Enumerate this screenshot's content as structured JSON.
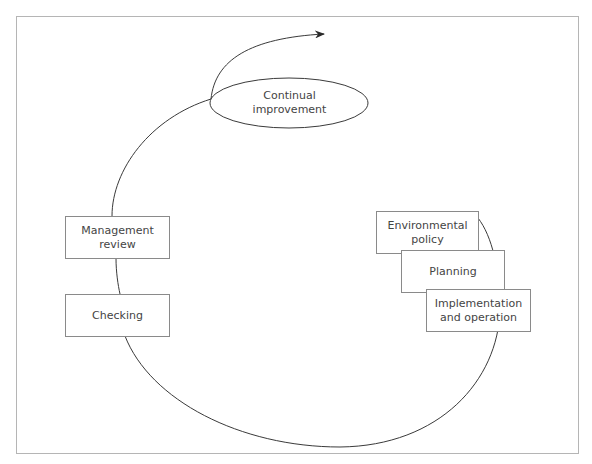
{
  "diagram": {
    "type": "cycle",
    "title": "",
    "nodes": [
      {
        "id": "continual-improvement",
        "label": "Continual\nimprovement",
        "shape": "ellipse"
      },
      {
        "id": "environmental-policy",
        "label": "Environmental\npolicy",
        "shape": "rect"
      },
      {
        "id": "planning",
        "label": "Planning",
        "shape": "rect"
      },
      {
        "id": "implementation-operation",
        "label": "Implementation\nand operation",
        "shape": "rect"
      },
      {
        "id": "checking",
        "label": "Checking",
        "shape": "rect"
      },
      {
        "id": "management-review",
        "label": "Management\nreview",
        "shape": "rect"
      }
    ],
    "flow": [
      "environmental-policy",
      "planning",
      "implementation-operation",
      "checking",
      "management-review",
      "continual-improvement"
    ],
    "flow_direction": "clockwise-spiral-upward",
    "colors": {
      "line": "#3a3a3a",
      "box_border": "#8a8a8a",
      "text": "#444444",
      "frame": "#b5b5b5"
    }
  }
}
